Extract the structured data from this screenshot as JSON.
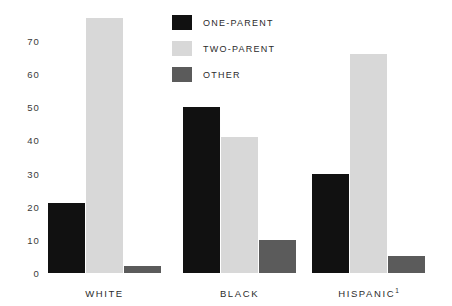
{
  "chart_data": {
    "type": "bar",
    "title": "",
    "subtitle": "",
    "xlabel": "",
    "ylabel": "",
    "categories": [
      "WHITE",
      "BLACK",
      "HISPANIC"
    ],
    "category_labels": [
      "WHITE",
      "BLACK",
      "HISPANIC¹"
    ],
    "category_footnotes": [
      "",
      "",
      "1"
    ],
    "series": [
      {
        "name": "ONE-PARENT",
        "color": "#111111",
        "values": [
          21,
          50,
          30
        ]
      },
      {
        "name": "TWO-PARENT",
        "color": "#d8d8d8",
        "values": [
          77,
          41,
          66
        ]
      },
      {
        "name": "OTHER",
        "color": "#5b5b5b",
        "values": [
          2,
          10,
          5
        ]
      }
    ],
    "ylim": [
      0,
      80
    ],
    "yticks": [
      0,
      10,
      20,
      30,
      40,
      50,
      60,
      70
    ],
    "ytick_labels": [
      "0",
      "10",
      "20",
      "30",
      "40",
      "50",
      "60",
      "70"
    ],
    "grid": false,
    "legend_position": "top-center"
  },
  "legend": {
    "items": [
      {
        "label": "ONE-PARENT",
        "color": "#111111"
      },
      {
        "label": "TWO-PARENT",
        "color": "#d8d8d8"
      },
      {
        "label": "OTHER",
        "color": "#5b5b5b"
      }
    ]
  },
  "colors": {
    "background": "#ffffff",
    "one_parent": "#111111",
    "two_parent": "#d8d8d8",
    "other": "#5b5b5b",
    "text": "#2b2b2b",
    "axis_text": "#3a3a3a"
  }
}
